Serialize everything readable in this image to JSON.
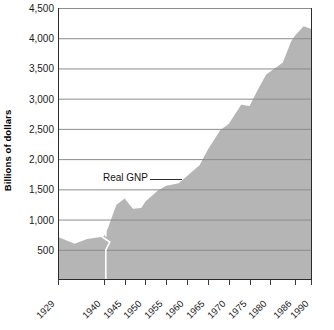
{
  "chart_data": {
    "type": "area",
    "title": "",
    "xlabel": "",
    "ylabel": "Billions of dollars",
    "ylim": [
      0,
      4500
    ],
    "xlim": [
      1929,
      1990
    ],
    "grid": true,
    "legend_position": "inline-annotation",
    "series_label": "Real GNP",
    "axis_break": {
      "at_year": 1940,
      "note": "white vertical break line with zigzag between 1929 and 1940 segments"
    },
    "y_ticks": [
      {
        "value": 4500,
        "label": "4,500"
      },
      {
        "value": 4000,
        "label": "4,000"
      },
      {
        "value": 3500,
        "label": "3,500"
      },
      {
        "value": 3000,
        "label": "3,000"
      },
      {
        "value": 2500,
        "label": "2,500"
      },
      {
        "value": 2000,
        "label": "2,000"
      },
      {
        "value": 1500,
        "label": "1,500"
      },
      {
        "value": 1000,
        "label": "1,000"
      },
      {
        "value": 500,
        "label": "500"
      }
    ],
    "x_ticks": [
      {
        "value": 1929,
        "label": "1929"
      },
      {
        "value": 1940,
        "label": "1940"
      },
      {
        "value": 1945,
        "label": "1945"
      },
      {
        "value": 1950,
        "label": "1950"
      },
      {
        "value": 1955,
        "label": "1955"
      },
      {
        "value": 1960,
        "label": "1960"
      },
      {
        "value": 1965,
        "label": "1965"
      },
      {
        "value": 1970,
        "label": "1970"
      },
      {
        "value": 1975,
        "label": "1975"
      },
      {
        "value": 1980,
        "label": "1980"
      },
      {
        "value": 1986,
        "label": "1986"
      },
      {
        "value": 1990,
        "label": "1990"
      }
    ],
    "series": [
      {
        "name": "Real GNP",
        "x": [
          1929,
          1933,
          1936,
          1940,
          1941,
          1943,
          1945,
          1947,
          1949,
          1950,
          1953,
          1955,
          1958,
          1960,
          1963,
          1965,
          1968,
          1970,
          1973,
          1975,
          1977,
          1979,
          1981,
          1983,
          1985,
          1986,
          1988,
          1990
        ],
        "values": [
          710,
          600,
          680,
          720,
          860,
          1240,
          1350,
          1180,
          1190,
          1300,
          1480,
          1560,
          1600,
          1720,
          1900,
          2160,
          2480,
          2580,
          2900,
          2880,
          3150,
          3400,
          3500,
          3600,
          3950,
          4050,
          4200,
          4150
        ]
      }
    ],
    "colors": {
      "area_fill": "#b5b5b5",
      "gridline": "#8c8c8c",
      "axis": "#2b2b2b",
      "text": "#1a1a1a",
      "break_line": "#ffffff"
    }
  }
}
